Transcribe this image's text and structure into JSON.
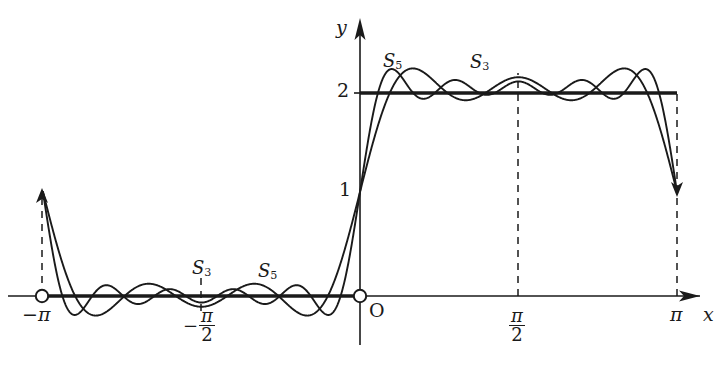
{
  "figure": {
    "background": "#ffffff",
    "ink": "#1a1a1a"
  },
  "axes": {
    "x_axis_label": "x",
    "y_axis_label": "y",
    "origin_label": "O",
    "x_ticks": [
      {
        "id": "neg-pi",
        "label": "−π",
        "value": -3.14159,
        "px": 42
      },
      {
        "id": "neg-pi-over2",
        "label": "−π/2",
        "value": -1.5708,
        "px": 201
      },
      {
        "id": "origin",
        "label": "O",
        "value": 0,
        "px": 360
      },
      {
        "id": "pi-over2",
        "label": "π/2",
        "value": 1.5708,
        "px": 518
      },
      {
        "id": "pi",
        "label": "π",
        "value": 3.14159,
        "px": 677
      }
    ],
    "y_ticks": [
      {
        "id": "y1",
        "label": "1",
        "value": 1,
        "px": 192
      },
      {
        "id": "y2",
        "label": "2",
        "value": 2,
        "px": 93
      }
    ],
    "xlim": [
      -3.4,
      3.6
    ],
    "ylim": [
      -0.95,
      2.95
    ],
    "grid": false,
    "arrowheads": [
      "x-positive",
      "y-positive"
    ]
  },
  "marks": {
    "open_circle_left_label": "open-point-at-minus-pi",
    "open_circle_origin_label": "open-point-at-origin",
    "dashed_verticals": [
      "-pi",
      "-pi/2",
      "pi/2",
      "pi"
    ],
    "target_segments": [
      {
        "name": "left-zero-level",
        "from": -3.14159,
        "to": 0,
        "y": 0
      },
      {
        "name": "right-two-level",
        "from": 0,
        "to": 3.14159,
        "y": 2
      }
    ]
  },
  "curve_labels": [
    {
      "id": "s3-left",
      "base": "S",
      "sub": "3",
      "x": 192,
      "y": 259
    },
    {
      "id": "s5-left",
      "base": "S",
      "sub": "5",
      "x": 258,
      "y": 262
    },
    {
      "id": "s5-right",
      "base": "S",
      "sub": "5",
      "x": 383,
      "y": 52
    },
    {
      "id": "s3-right",
      "base": "S",
      "sub": "3",
      "x": 470,
      "y": 53
    }
  ],
  "chart_data": {
    "type": "line",
    "xlabel": "x",
    "ylabel": "y",
    "xlim": [
      -3.4,
      3.6
    ],
    "ylim": [
      -0.95,
      2.95
    ],
    "grid": false,
    "legend_position": "inline-annotations",
    "x_tick_labels": [
      "−π",
      "−π/2",
      "O",
      "π/2",
      "π"
    ],
    "x_tick_values": [
      -3.14159,
      -1.5708,
      0,
      1.5708,
      3.14159
    ],
    "y_tick_labels": [
      "1",
      "2"
    ],
    "y_tick_values": [
      1,
      2
    ],
    "annotations": [
      "S₃",
      "S₅",
      "S₅",
      "S₃"
    ],
    "series": [
      {
        "name": "f(x) target square wave",
        "style": "thick-solid",
        "description": "0 on (-pi,0), 2 on (0,pi), open points at x=-pi and x=0",
        "values_at": [
          {
            "x": -3.14159,
            "y": 0
          },
          {
            "x": -0.001,
            "y": 0
          },
          {
            "x": 0.001,
            "y": 2
          },
          {
            "x": 3.14159,
            "y": 2
          }
        ]
      },
      {
        "name": "S3",
        "style": "thin-solid",
        "formula": "1 + (4/pi)*( sin x /1 + sin 3x /3 + sin 5x /5 )",
        "terms": 3,
        "odd_harmonics": [
          1,
          3,
          5
        ],
        "overshoot_peak": 2.28,
        "undershoot_min": -0.28
      },
      {
        "name": "S5",
        "style": "thin-solid",
        "formula": "1 + (4/pi)*( sin x /1 + sin 3x /3 + sin 5x /5 + sin 7x /7 + sin 9x /9 )",
        "terms": 5,
        "odd_harmonics": [
          1,
          3,
          5,
          7,
          9
        ],
        "overshoot_peak": 2.27,
        "undershoot_min": -0.27
      }
    ]
  }
}
